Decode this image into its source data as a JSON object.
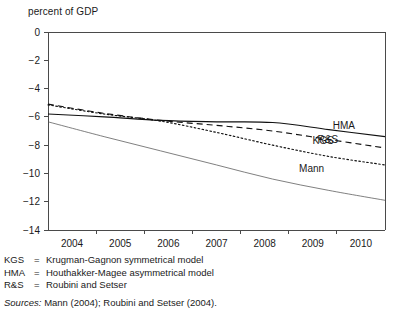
{
  "chart_data": {
    "type": "line",
    "title": "",
    "ylabel": "percent of GDP",
    "xlabel": "",
    "ylim": [
      -14,
      0
    ],
    "xlim": [
      2004,
      2010
    ],
    "grid": false,
    "legend_position": "inline-right",
    "ytick_labels": [
      "0",
      "−2",
      "−4",
      "−6",
      "−8",
      "−10",
      "−12",
      "−14"
    ],
    "ytick_values": [
      0,
      -2,
      -4,
      -6,
      -8,
      -10,
      -12,
      -14
    ],
    "xtick_labels": [
      "2004",
      "2005",
      "2006",
      "2007",
      "2008",
      "2009",
      "2010"
    ],
    "x": [
      2004,
      2005,
      2006,
      2007,
      2008,
      2009,
      2010
    ],
    "series": [
      {
        "name": "KGS",
        "style": "solid",
        "label": "KGS",
        "values": [
          -5.8,
          -6.0,
          -6.25,
          -6.35,
          -6.4,
          -6.9,
          -7.4
        ]
      },
      {
        "name": "HMA",
        "style": "dashed",
        "label": "HMA",
        "values": [
          -5.1,
          -5.75,
          -6.25,
          -6.6,
          -7.0,
          -7.6,
          -8.2
        ]
      },
      {
        "name": "R&S",
        "style": "dotted",
        "label": "R&S",
        "values": [
          -5.15,
          -5.8,
          -6.3,
          -7.1,
          -8.0,
          -8.8,
          -9.4
        ]
      },
      {
        "name": "Mann",
        "style": "thin-solid",
        "label": "Mann",
        "values": [
          -6.35,
          -7.4,
          -8.4,
          -9.4,
          -10.4,
          -11.2,
          -11.9
        ]
      }
    ]
  },
  "notes": {
    "rows": [
      {
        "abbr": "KGS",
        "eq": "=",
        "text": "Krugman-Gagnon symmetrical model"
      },
      {
        "abbr": "HMA",
        "eq": "=",
        "text": "Houthakker-Magee asymmetrical model"
      },
      {
        "abbr": "R&S",
        "eq": "=",
        "text": "Roubini and Setser"
      }
    ],
    "sources_label": "Sources:",
    "sources_text": "Mann (2004); Roubini and Setser (2004)."
  },
  "colors": {
    "axis": "#4a4a4a",
    "line": "#111111",
    "line_thin": "#555555",
    "text": "#1a1a1a",
    "background": "#ffffff"
  }
}
